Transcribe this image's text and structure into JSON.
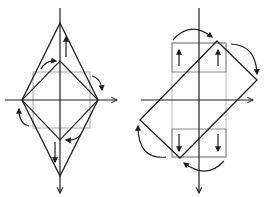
{
  "figure": {
    "colors": {
      "ink": "#1e1e1e",
      "guide": "#a8a8a8",
      "background": "#ffffff"
    },
    "left_panel": {
      "shape": "diamond stretched vertically",
      "axes": {
        "horizontal_arrow": "right",
        "vertical_arrow": "down"
      },
      "guide": "gray square",
      "arrows": [
        "up",
        "down",
        "clockwise-top",
        "clockwise-right",
        "clockwise-bottom",
        "clockwise-left"
      ]
    },
    "right_panel": {
      "shape": "rotated rectangle",
      "axes": {
        "horizontal_arrow": "right",
        "vertical_arrow": "down"
      },
      "guide": "gray rectangle column with top and bottom boxes",
      "arrows": [
        "up",
        "up",
        "down",
        "down",
        "clockwise-top",
        "clockwise-right",
        "clockwise-bottom",
        "clockwise-left"
      ]
    }
  }
}
